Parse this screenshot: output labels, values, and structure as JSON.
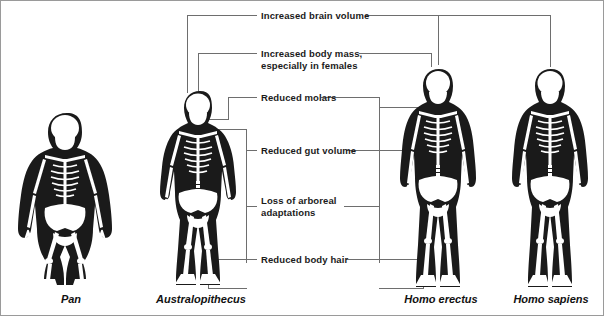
{
  "figure": {
    "width": 604,
    "height": 316,
    "background_color": "#ffffff",
    "line_color": "#6e6e6e",
    "text_color": "#1b1b1b",
    "bone_color": "#ffffff",
    "silhouette_color": "#1a1a1a"
  },
  "annotations": [
    {
      "id": "brain",
      "text": "Increased brain volume"
    },
    {
      "id": "mass",
      "text": "Increased body mass,\nespecially in females"
    },
    {
      "id": "molars",
      "text": "Reduced molars"
    },
    {
      "id": "gut",
      "text": "Reduced gut volume"
    },
    {
      "id": "arboreal",
      "text": "Loss of arboreal\nadaptations"
    },
    {
      "id": "hair",
      "text": "Reduced body hair"
    }
  ],
  "species": [
    {
      "id": "pan",
      "label": "Pan"
    },
    {
      "id": "australopithecus",
      "label": "Australopithecus"
    },
    {
      "id": "homo-erectus",
      "label": "Homo erectus"
    },
    {
      "id": "homo-sapiens",
      "label": "Homo sapiens"
    }
  ]
}
